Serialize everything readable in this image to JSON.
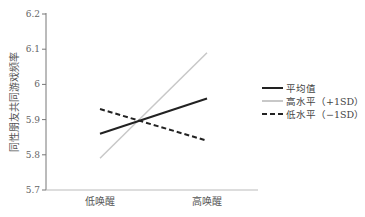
{
  "chart_data": {
    "type": "line",
    "title": "",
    "xlabel": "",
    "ylabel": "同性朋友共同游戏频率",
    "categories": [
      "低唤醒",
      "高唤醒"
    ],
    "ylim": [
      5.7,
      6.2
    ],
    "yticks": [
      "5.7",
      "5.8",
      "5.9",
      "6",
      "6.1",
      "6.2"
    ],
    "grid": false,
    "legend_position": "right",
    "series": [
      {
        "name": "平均值",
        "style": "solid",
        "color": "#222222",
        "values": [
          5.86,
          5.96
        ]
      },
      {
        "name": "高水平（+1SD）",
        "style": "solid",
        "color": "#c8c8c8",
        "values": [
          5.79,
          6.09
        ]
      },
      {
        "name": "低水平（−1SD）",
        "style": "dashed",
        "color": "#222222",
        "values": [
          5.93,
          5.84
        ]
      }
    ]
  }
}
